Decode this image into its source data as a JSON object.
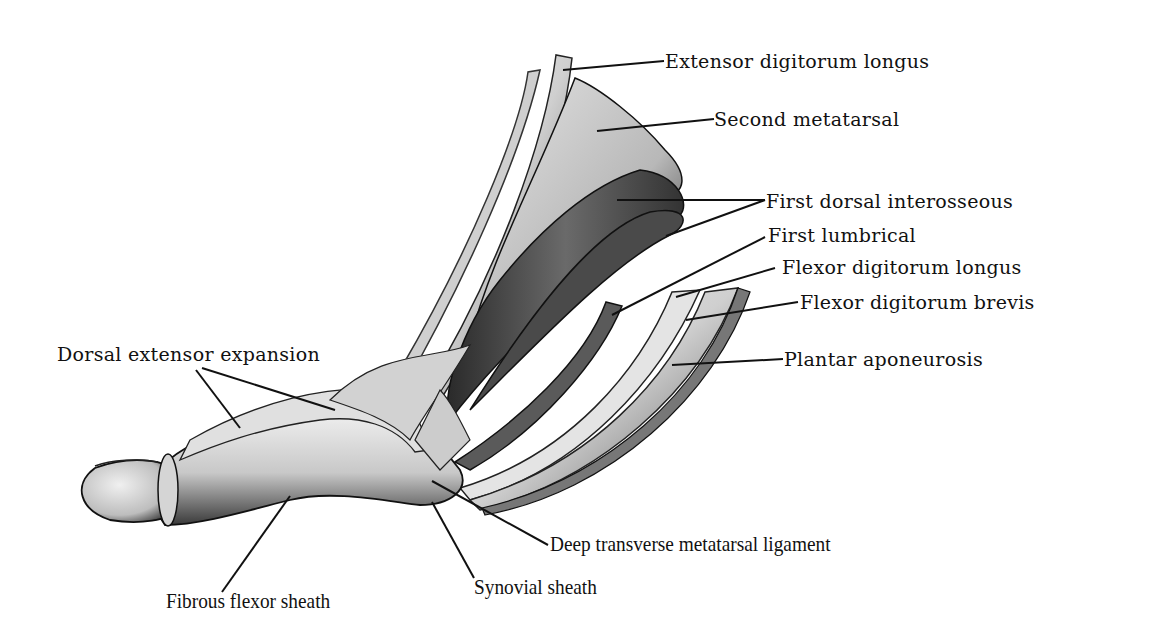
{
  "figure": {
    "background": "#ffffff",
    "ink_color": "#111111"
  },
  "labels": {
    "extensor_digitorum_longus": "Extensor digitorum longus",
    "second_metatarsal": "Second metatarsal",
    "first_dorsal_interosseous": "First dorsal interosseous",
    "first_lumbrical": "First lumbrical",
    "flexor_digitorum_longus": "Flexor digitorum longus",
    "flexor_digitorum_brevis": "Flexor digitorum brevis",
    "plantar_aponeurosis": "Plantar aponeurosis",
    "dorsal_extensor_expansion": "Dorsal extensor expansion",
    "deep_transverse_metatarsal_ligament": "Deep transverse metatarsal ligament",
    "synovial_sheath": "Synovial sheath",
    "fibrous_flexor_sheath": "Fibrous flexor sheath"
  }
}
